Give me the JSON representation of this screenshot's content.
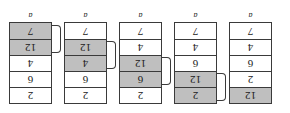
{
  "figure": {
    "title": "",
    "rotated_180": true,
    "colors": {
      "shaded_cell": "#bfbfbf",
      "plain_cell": "#ffffff",
      "border": "#3a3a3a",
      "text": "#1a1a1a"
    },
    "panels": [
      {
        "label": "a",
        "cells": [
          {
            "value": "12",
            "shaded": true
          },
          {
            "value": "2",
            "shaded": false
          },
          {
            "value": "6",
            "shaded": false
          },
          {
            "value": "4",
            "shaded": false
          },
          {
            "value": "7",
            "shaded": false
          }
        ],
        "bracket": null
      },
      {
        "label": "a",
        "cells": [
          {
            "value": "2",
            "shaded": true
          },
          {
            "value": "12",
            "shaded": true
          },
          {
            "value": "6",
            "shaded": false
          },
          {
            "value": "4",
            "shaded": false
          },
          {
            "value": "7",
            "shaded": false
          }
        ],
        "bracket": {
          "from_index": 0,
          "to_index": 1
        }
      },
      {
        "label": "a",
        "cells": [
          {
            "value": "2",
            "shaded": false
          },
          {
            "value": "6",
            "shaded": true
          },
          {
            "value": "12",
            "shaded": true
          },
          {
            "value": "4",
            "shaded": false
          },
          {
            "value": "7",
            "shaded": false
          }
        ],
        "bracket": {
          "from_index": 1,
          "to_index": 2
        }
      },
      {
        "label": "a",
        "cells": [
          {
            "value": "2",
            "shaded": false
          },
          {
            "value": "6",
            "shaded": false
          },
          {
            "value": "4",
            "shaded": true
          },
          {
            "value": "12",
            "shaded": true
          },
          {
            "value": "7",
            "shaded": false
          }
        ],
        "bracket": {
          "from_index": 2,
          "to_index": 3
        }
      },
      {
        "label": "a",
        "cells": [
          {
            "value": "2",
            "shaded": false
          },
          {
            "value": "6",
            "shaded": false
          },
          {
            "value": "4",
            "shaded": false
          },
          {
            "value": "12",
            "shaded": true
          },
          {
            "value": "7",
            "shaded": true
          }
        ],
        "bracket": {
          "from_index": 3,
          "to_index": 4
        }
      }
    ]
  }
}
